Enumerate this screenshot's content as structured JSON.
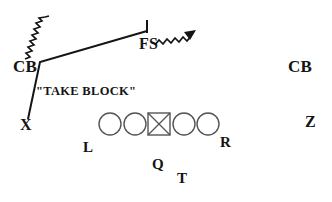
{
  "diagram": {
    "type": "football-play-diagram",
    "background_color": "#ffffff",
    "ink_color": "#141414",
    "line_color": "#141414",
    "player_marker_color": "#555555",
    "annotations": {
      "take_block": "\"TAKE BLOCK\""
    },
    "defense_labels": {
      "cornerback_left": "CB",
      "free_safety": "FS",
      "cornerback_right": "CB"
    },
    "offense_labels": {
      "receiver_x": "X",
      "receiver_z": "Z",
      "left_end": "L",
      "right_end": "R",
      "quarterback": "Q",
      "tailback": "T"
    },
    "offensive_line": {
      "marker_count": 5,
      "center_marker": "square-with-x",
      "other_markers": "circle",
      "markers": [
        {
          "shape": "circle",
          "cx": 110,
          "cy": 124,
          "r": 11
        },
        {
          "shape": "circle",
          "cx": 135,
          "cy": 124,
          "r": 11
        },
        {
          "shape": "square-x",
          "cx": 159,
          "cy": 124,
          "r": 11
        },
        {
          "shape": "circle",
          "cx": 184,
          "cy": 124,
          "r": 11
        },
        {
          "shape": "circle",
          "cx": 208,
          "cy": 124,
          "r": 11
        }
      ]
    },
    "routes": [
      {
        "name": "x-release-to-cb-then-to-fs",
        "style": "solid-line-with-end-bar",
        "points": "28,119 40,62 147,31",
        "end_bar": {
          "x": 147,
          "y1": 20,
          "y2": 33
        }
      }
    ],
    "motion_squiggles": [
      {
        "name": "cb-left-blitz-squiggle",
        "from": [
          26,
          59
        ],
        "to": [
          50,
          17
        ],
        "has_arrowhead": false
      },
      {
        "name": "fs-squiggle-arrow",
        "from": [
          156,
          44
        ],
        "to": [
          186,
          26
        ],
        "has_arrowhead": true
      }
    ]
  }
}
